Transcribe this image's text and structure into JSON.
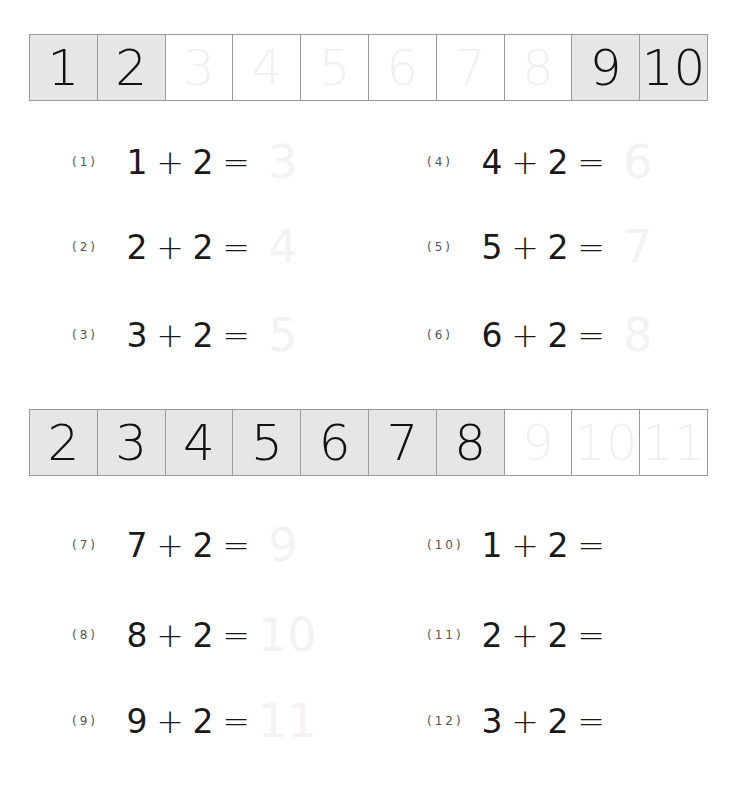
{
  "strips": [
    {
      "cells": [
        {
          "value": "1",
          "style": "filled"
        },
        {
          "value": "2",
          "style": "filled"
        },
        {
          "value": "3",
          "style": "trace"
        },
        {
          "value": "4",
          "style": "trace"
        },
        {
          "value": "5",
          "style": "trace"
        },
        {
          "value": "6",
          "style": "trace"
        },
        {
          "value": "7",
          "style": "trace"
        },
        {
          "value": "8",
          "style": "trace"
        },
        {
          "value": "9",
          "style": "filled"
        },
        {
          "value": "10",
          "style": "filled"
        }
      ]
    },
    {
      "cells": [
        {
          "value": "2",
          "style": "filled"
        },
        {
          "value": "3",
          "style": "filled"
        },
        {
          "value": "4",
          "style": "filled"
        },
        {
          "value": "5",
          "style": "filled"
        },
        {
          "value": "6",
          "style": "filled"
        },
        {
          "value": "7",
          "style": "filled"
        },
        {
          "value": "8",
          "style": "filled"
        },
        {
          "value": "9",
          "style": "trace"
        },
        {
          "value": "10",
          "style": "trace"
        },
        {
          "value": "11",
          "style": "trace"
        }
      ]
    }
  ],
  "problems": [
    {
      "label": "(1)",
      "a": "1",
      "op": "+",
      "b": "2",
      "eq": "=",
      "answer_trace": "3"
    },
    {
      "label": "(2)",
      "a": "2",
      "op": "+",
      "b": "2",
      "eq": "=",
      "answer_trace": "4"
    },
    {
      "label": "(3)",
      "a": "3",
      "op": "+",
      "b": "2",
      "eq": "=",
      "answer_trace": "5"
    },
    {
      "label": "(4)",
      "a": "4",
      "op": "+",
      "b": "2",
      "eq": "=",
      "answer_trace": "6"
    },
    {
      "label": "(5)",
      "a": "5",
      "op": "+",
      "b": "2",
      "eq": "=",
      "answer_trace": "7"
    },
    {
      "label": "(6)",
      "a": "6",
      "op": "+",
      "b": "2",
      "eq": "=",
      "answer_trace": "8"
    },
    {
      "label": "(7)",
      "a": "7",
      "op": "+",
      "b": "2",
      "eq": "=",
      "answer_trace": "9"
    },
    {
      "label": "(8)",
      "a": "8",
      "op": "+",
      "b": "2",
      "eq": "=",
      "answer_trace": "10"
    },
    {
      "label": "(9)",
      "a": "9",
      "op": "+",
      "b": "2",
      "eq": "=",
      "answer_trace": "11"
    },
    {
      "label": "(10)",
      "a": "1",
      "op": "+",
      "b": "2",
      "eq": "=",
      "answer_trace": ""
    },
    {
      "label": "(11)",
      "a": "2",
      "op": "+",
      "b": "2",
      "eq": "=",
      "answer_trace": ""
    },
    {
      "label": "(12)",
      "a": "3",
      "op": "+",
      "b": "2",
      "eq": "=",
      "answer_trace": ""
    }
  ]
}
